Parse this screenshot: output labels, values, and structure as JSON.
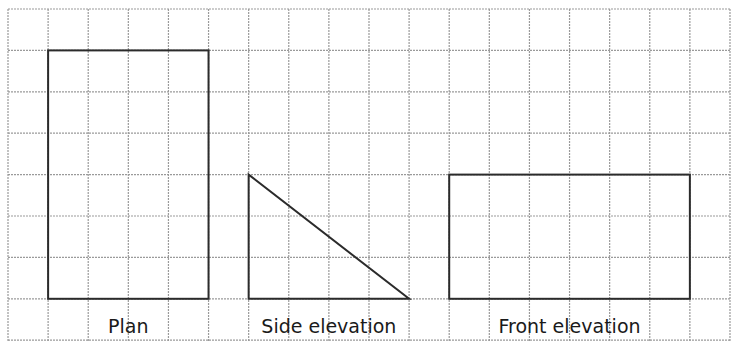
{
  "diagram": {
    "type": "orthographic-projection",
    "grid": {
      "origin_x": 8,
      "origin_y": 9,
      "cols": 18,
      "rows": 8,
      "cell_w": 40.11,
      "cell_h": 41.4,
      "line_color": "#9a9a9a"
    },
    "views": [
      {
        "id": "plan",
        "label": "Plan",
        "shape": "rectangle",
        "grid_col": 1,
        "grid_row": 1,
        "width_cells": 4,
        "height_cells": 6
      },
      {
        "id": "side-elevation",
        "label": "Side elevation",
        "shape": "right-triangle",
        "grid_col": 6,
        "grid_row": 4,
        "width_cells": 4,
        "height_cells": 3,
        "right_angle": "bottom-left"
      },
      {
        "id": "front-elevation",
        "label": "Front elevation",
        "shape": "rectangle",
        "grid_col": 11,
        "grid_row": 4,
        "width_cells": 6,
        "height_cells": 3
      }
    ],
    "shape_color": "#2b2b2b"
  }
}
